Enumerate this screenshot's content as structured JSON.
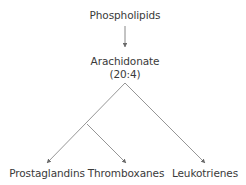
{
  "diagram": {
    "type": "pathway-tree",
    "nodes": {
      "phospholipids": {
        "label": "Phospholipids"
      },
      "arachidonate": {
        "label": "Arachidonate",
        "sublabel": "(20:4)"
      },
      "prostaglandins": {
        "label": "Prostaglandins"
      },
      "thromboxanes": {
        "label": "Thromboxanes"
      },
      "leukotrienes": {
        "label": "Leukotrienes"
      }
    },
    "edges": [
      {
        "from": "phospholipids",
        "to": "arachidonate"
      },
      {
        "from": "arachidonate",
        "to": "prostaglandins"
      },
      {
        "from": "arachidonate",
        "to": "thromboxanes",
        "via": "shared branch with prostaglandins"
      },
      {
        "from": "arachidonate",
        "to": "leukotrienes"
      }
    ],
    "colors": {
      "line": "#8a8a8a",
      "text": "#3a3a3a",
      "background": "#ffffff"
    }
  }
}
